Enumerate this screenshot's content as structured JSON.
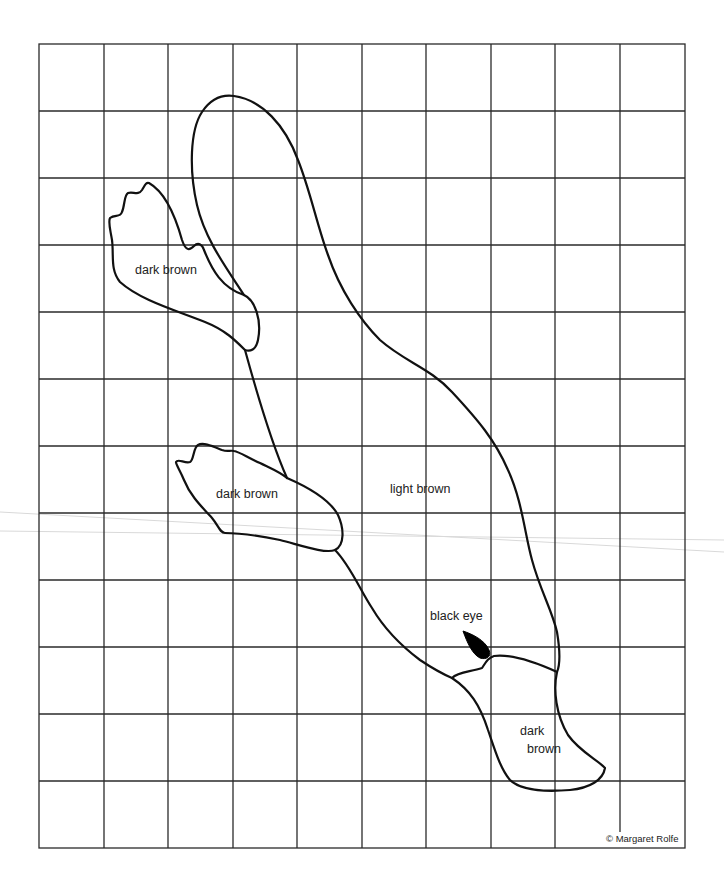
{
  "pattern": {
    "title": "Platypus grid pattern",
    "grid": {
      "columns": 10,
      "rows": 12,
      "left": 39,
      "top": 44,
      "right": 685,
      "bottom": 848,
      "line_color": "#2a2a2a"
    },
    "labels": {
      "back_foot": "dark brown",
      "front_foot": "dark brown",
      "body": "light brown",
      "eye": "black eye",
      "bill_line1": "dark",
      "bill_line2": "brown"
    },
    "copyright": "© Margaret Rolfe",
    "colors": {
      "outline": "#111111",
      "eye_fill": "#000000",
      "background": "#ffffff"
    }
  }
}
